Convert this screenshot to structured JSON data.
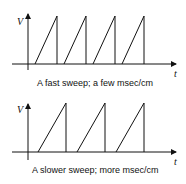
{
  "panels": [
    {
      "y_label": "V",
      "x_label": "t",
      "caption": "A fast sweep; a few msec/cm",
      "ramp_count": 4
    },
    {
      "y_label": "V",
      "x_label": "t",
      "caption": "A slower sweep; more msec/cm",
      "ramp_count": 3
    }
  ],
  "colors": {
    "stroke": "#111111",
    "background": "#ffffff"
  }
}
